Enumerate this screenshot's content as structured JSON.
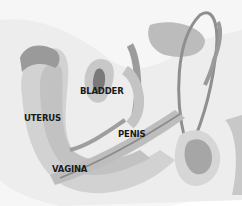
{
  "diagram": {
    "type": "anatomical-cross-section",
    "labels": {
      "bladder": "BLADDER",
      "uterus": "UTERUS",
      "penis": "PENIS",
      "vagina": "VAGINA"
    },
    "colors": {
      "background": "#ffffff",
      "skin_light": "#ececec",
      "tissue_mid": "#d4d4d4",
      "tissue_dark": "#a8a8a8",
      "organ_dark": "#8a8a8a",
      "label_text": "#1a1a1a"
    }
  }
}
